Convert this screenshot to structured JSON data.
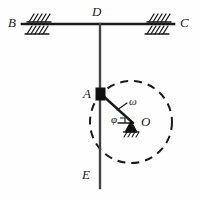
{
  "figure": {
    "type": "mechanism-diagram",
    "colors": {
      "line": "#1a1a1a",
      "background": "#fefefe",
      "block_fill": "#111111",
      "dashed": "#1a1a1a"
    },
    "labels": {
      "B": "B",
      "C": "C",
      "D": "D",
      "E": "E",
      "A": "A",
      "O": "O",
      "omega": "ω",
      "phi": "φ"
    },
    "geometry": {
      "beam": {
        "x1": 22,
        "y1": 24,
        "x2": 174,
        "y2": 24
      },
      "rod": {
        "x1": 100,
        "y1": 24,
        "x2": 100,
        "y2": 188
      },
      "block_A": {
        "x": 96,
        "y": 88,
        "w": 9,
        "h": 12
      },
      "pivot_O": {
        "x": 131,
        "y": 122
      },
      "crank": {
        "x1": 101,
        "y1": 94,
        "x2": 131,
        "y2": 122
      },
      "circle": {
        "cx": 131,
        "cy": 122,
        "r": 41
      },
      "support_left": {
        "x": 38,
        "y": 24
      },
      "support_right": {
        "x": 158,
        "y": 24
      }
    },
    "annotations": {
      "angular_velocity": "ω",
      "crank_angle": "φ",
      "right_angle_marker": true,
      "dashed_path_note": "circular path of A about O"
    }
  }
}
